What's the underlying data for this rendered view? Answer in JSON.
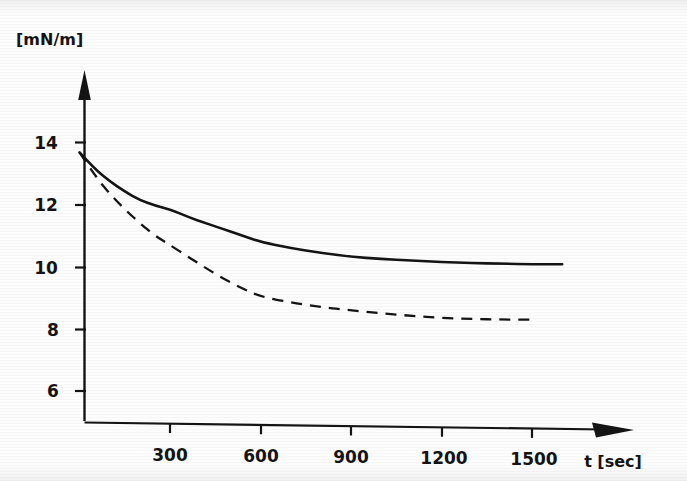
{
  "figure": {
    "background_color": "#fdfdfd",
    "ink_color": "#141414",
    "y_axis_unit_label": "[mN/m]",
    "x_axis_title": "t [sec]"
  },
  "chart_data": {
    "type": "line",
    "title": "",
    "xlabel": "t [sec]",
    "ylabel": "[mN/m]",
    "xlim": [
      0,
      1800
    ],
    "ylim": [
      5,
      14.9
    ],
    "xticks": [
      300,
      600,
      900,
      1200,
      1500
    ],
    "xtick_labels": [
      "300",
      "600",
      "900",
      "1200",
      "1500"
    ],
    "yticks": [
      6,
      8,
      10,
      12,
      14
    ],
    "ytick_labels": [
      "6",
      "8",
      "10",
      "12",
      "14"
    ],
    "grid": false,
    "legend": "none",
    "legend_position": "none",
    "series": [
      {
        "name": "solid-curve",
        "style": "solid",
        "color": "#141414",
        "x": [
          0,
          50,
          100,
          150,
          200,
          250,
          300,
          360,
          420,
          480,
          540,
          600,
          700,
          800,
          900,
          1000,
          1100,
          1200,
          1300,
          1400,
          1500,
          1600
        ],
        "values": [
          13.68,
          13.15,
          12.75,
          12.42,
          12.15,
          11.97,
          11.85,
          11.6,
          11.4,
          11.2,
          11.0,
          10.8,
          10.6,
          10.45,
          10.32,
          10.25,
          10.2,
          10.15,
          10.12,
          10.1,
          10.08,
          10.08
        ]
      },
      {
        "name": "dashed-curve",
        "style": "dashed",
        "color": "#141414",
        "x": [
          0,
          50,
          100,
          150,
          200,
          250,
          300,
          360,
          420,
          480,
          540,
          600,
          700,
          800,
          900,
          1000,
          1100,
          1200,
          1300,
          1400,
          1500
        ],
        "values": [
          13.68,
          12.95,
          12.35,
          11.85,
          11.4,
          11.0,
          10.7,
          10.32,
          9.95,
          9.6,
          9.3,
          9.04,
          8.85,
          8.7,
          8.6,
          8.5,
          8.42,
          8.35,
          8.32,
          8.3,
          8.3
        ]
      }
    ]
  }
}
